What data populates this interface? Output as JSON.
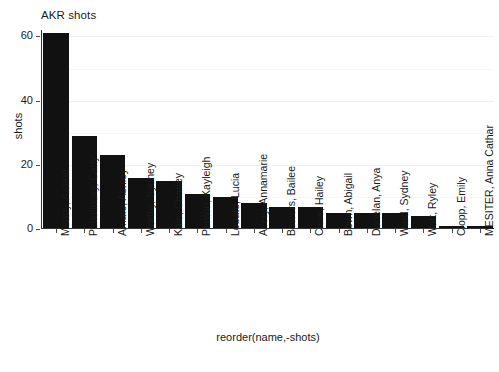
{
  "chart_data": {
    "type": "bar",
    "title": "AKR shots",
    "xlabel": "reorder(name,-shots)",
    "ylabel": "shots",
    "ylim": [
      0,
      62
    ],
    "yticks": [
      0,
      20,
      40,
      60
    ],
    "ytick_labels": [
      "0",
      "20",
      "40",
      "60"
    ],
    "minor_gridlines": [
      10,
      30,
      50
    ],
    "grid": true,
    "legend": null,
    "bar_color": "#111111",
    "panel_background": "#ffffff",
    "gridline_color": "#f1f1f1",
    "categories": [
      "Meany, Aislinn",
      "Pcholinsky, Carly",
      "Amato, Ashley",
      "Worthy, Sydney",
      "Kale, Charley",
      "Penton, Kayleigh",
      "Lobato, Lucia",
      "Alfery, Annamarie",
      "Bowers, Bailee",
      "Clere, Hailey",
      "Bown, Abigail",
      "Donelan, Anya",
      "Ward, Sydney",
      "Watt, Ryley",
      "Clopp, Emily",
      "MESITER, Anna Cathar"
    ],
    "values": [
      61,
      29,
      23,
      16,
      15,
      11,
      10,
      8,
      7,
      7,
      5,
      5,
      5,
      4,
      1,
      1
    ]
  }
}
